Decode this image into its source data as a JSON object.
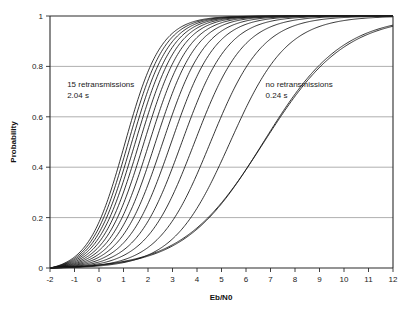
{
  "chart_data": {
    "type": "line",
    "title": "",
    "xlabel": "Eb/N0",
    "ylabel": "Probability",
    "xlim": [
      -2,
      12
    ],
    "ylim": [
      0,
      1
    ],
    "grid": true,
    "grid_axis": "y",
    "legend": "none",
    "xticks": [
      "-2",
      "-1",
      "0",
      "1",
      "2",
      "3",
      "4",
      "5",
      "6",
      "7",
      "8",
      "9",
      "10",
      "11",
      "12"
    ],
    "xtick_values": [
      -2,
      -1,
      0,
      1,
      2,
      3,
      4,
      5,
      6,
      7,
      8,
      9,
      10,
      11,
      12
    ],
    "yticks": [
      "0",
      "0.2",
      "0.4",
      "0.6",
      "0.8",
      "1"
    ],
    "ytick_values": [
      0,
      0.2,
      0.4,
      0.6,
      0.8,
      1
    ],
    "annotations": [
      {
        "name": "left-annotation",
        "line1": "15 retransmissions",
        "line2": "2.04 s",
        "x": -1.3,
        "y": 0.72
      },
      {
        "name": "right-annotation",
        "line1": "no retransmissions",
        "line2": "0.24 s",
        "x": 6.8,
        "y": 0.72
      }
    ],
    "series": [
      {
        "name": "15 retransmissions (2.04 s)",
        "midpoint": 1.05,
        "slope": 1.35,
        "values_x": [
          -2,
          -1,
          0,
          1,
          2,
          3,
          4,
          5,
          6,
          7,
          8,
          9,
          10,
          11,
          12
        ],
        "values": [
          0.017,
          0.057,
          0.196,
          0.5,
          0.804,
          0.943,
          0.983,
          0.995,
          0.999,
          1.0,
          1.0,
          1.0,
          1.0,
          1.0,
          1.0
        ]
      },
      {
        "name": "14 retransmissions",
        "midpoint": 1.18,
        "slope": 1.33,
        "values_x": [
          -2,
          -1,
          0,
          1,
          2,
          3,
          4,
          5,
          6,
          7,
          8,
          9,
          10,
          11,
          12
        ],
        "values": [
          0.015,
          0.05,
          0.173,
          0.44,
          0.76,
          0.925,
          0.979,
          0.994,
          0.998,
          1.0,
          1.0,
          1.0,
          1.0,
          1.0,
          1.0
        ]
      },
      {
        "name": "13 retransmissions",
        "midpoint": 1.32,
        "slope": 1.31,
        "values_x": [
          -2,
          -1,
          0,
          1,
          2,
          3,
          4,
          5,
          6,
          7,
          8,
          9,
          10,
          11,
          12
        ],
        "values": [
          0.013,
          0.045,
          0.153,
          0.4,
          0.72,
          0.91,
          0.974,
          0.992,
          0.998,
          0.999,
          1.0,
          1.0,
          1.0,
          1.0,
          1.0
        ]
      },
      {
        "name": "12 retransmissions",
        "midpoint": 1.47,
        "slope": 1.29,
        "values_x": [
          -2,
          -1,
          0,
          1,
          2,
          3,
          4,
          5,
          6,
          7,
          8,
          9,
          10,
          11,
          12
        ],
        "values": [
          0.012,
          0.04,
          0.136,
          0.36,
          0.675,
          0.89,
          0.968,
          0.99,
          0.997,
          0.999,
          1.0,
          1.0,
          1.0,
          1.0,
          1.0
        ]
      },
      {
        "name": "11 retransmissions",
        "midpoint": 1.64,
        "slope": 1.27,
        "values_x": [
          -2,
          -1,
          0,
          1,
          2,
          3,
          4,
          5,
          6,
          7,
          8,
          9,
          10,
          11,
          12
        ],
        "values": [
          0.011,
          0.036,
          0.12,
          0.32,
          0.625,
          0.865,
          0.959,
          0.987,
          0.996,
          0.999,
          1.0,
          1.0,
          1.0,
          1.0,
          1.0
        ]
      },
      {
        "name": "10 retransmissions",
        "midpoint": 1.83,
        "slope": 1.25,
        "values_x": [
          -2,
          -1,
          0,
          1,
          2,
          3,
          4,
          5,
          6,
          7,
          8,
          9,
          10,
          11,
          12
        ],
        "values": [
          0.01,
          0.032,
          0.105,
          0.282,
          0.57,
          0.833,
          0.948,
          0.984,
          0.995,
          0.998,
          0.999,
          1.0,
          1.0,
          1.0,
          1.0
        ]
      },
      {
        "name": "9 retransmissions",
        "midpoint": 2.05,
        "slope": 1.22,
        "values_x": [
          -2,
          -1,
          0,
          1,
          2,
          3,
          4,
          5,
          6,
          7,
          8,
          9,
          10,
          11,
          12
        ],
        "values": [
          0.009,
          0.029,
          0.091,
          0.244,
          0.513,
          0.795,
          0.932,
          0.979,
          0.994,
          0.998,
          0.999,
          1.0,
          1.0,
          1.0,
          1.0
        ]
      },
      {
        "name": "8 retransmissions",
        "midpoint": 2.3,
        "slope": 1.19,
        "values_x": [
          -2,
          -1,
          0,
          1,
          2,
          3,
          4,
          5,
          6,
          7,
          8,
          9,
          10,
          11,
          12
        ],
        "values": [
          0.008,
          0.026,
          0.079,
          0.208,
          0.45,
          0.748,
          0.911,
          0.972,
          0.992,
          0.997,
          0.999,
          1.0,
          1.0,
          1.0,
          1.0
        ]
      },
      {
        "name": "7 retransmissions",
        "midpoint": 2.6,
        "slope": 1.15,
        "values_x": [
          -2,
          -1,
          0,
          1,
          2,
          3,
          4,
          5,
          6,
          7,
          8,
          9,
          10,
          11,
          12
        ],
        "values": [
          0.007,
          0.023,
          0.068,
          0.173,
          0.382,
          0.69,
          0.882,
          0.962,
          0.989,
          0.996,
          0.999,
          1.0,
          1.0,
          1.0,
          1.0
        ]
      },
      {
        "name": "6 retransmissions",
        "midpoint": 2.95,
        "slope": 1.11,
        "values_x": [
          -2,
          -1,
          0,
          1,
          2,
          3,
          4,
          5,
          6,
          7,
          8,
          9,
          10,
          11,
          12
        ],
        "values": [
          0.006,
          0.02,
          0.058,
          0.142,
          0.315,
          0.614,
          0.843,
          0.947,
          0.984,
          0.995,
          0.998,
          0.999,
          1.0,
          1.0,
          1.0
        ]
      },
      {
        "name": "5 retransmissions",
        "midpoint": 3.38,
        "slope": 1.06,
        "values_x": [
          -2,
          -1,
          0,
          1,
          2,
          3,
          4,
          5,
          6,
          7,
          8,
          9,
          10,
          11,
          12
        ],
        "values": [
          0.005,
          0.017,
          0.048,
          0.114,
          0.251,
          0.512,
          0.786,
          0.923,
          0.975,
          0.992,
          0.997,
          0.999,
          1.0,
          1.0,
          1.0
        ]
      },
      {
        "name": "4 retransmissions",
        "midpoint": 3.9,
        "slope": 1.0,
        "values_x": [
          -2,
          -1,
          0,
          1,
          2,
          3,
          4,
          5,
          6,
          7,
          8,
          9,
          10,
          11,
          12
        ],
        "values": [
          0.003,
          0.013,
          0.038,
          0.09,
          0.194,
          0.389,
          0.711,
          0.888,
          0.961,
          0.987,
          0.995,
          0.998,
          0.999,
          1.0,
          1.0
        ]
      },
      {
        "name": "3 retransmissions",
        "midpoint": 4.55,
        "slope": 0.94,
        "values_x": [
          -2,
          -1,
          0,
          1,
          2,
          3,
          4,
          5,
          6,
          7,
          8,
          9,
          10,
          11,
          12
        ],
        "values": [
          0.002,
          0.01,
          0.029,
          0.069,
          0.148,
          0.292,
          0.557,
          0.826,
          0.935,
          0.977,
          0.991,
          0.997,
          0.999,
          1.0,
          1.0
        ]
      },
      {
        "name": "2 retransmissions",
        "midpoint": 5.35,
        "slope": 0.86,
        "values_x": [
          -2,
          -1,
          0,
          1,
          2,
          3,
          4,
          5,
          6,
          7,
          8,
          9,
          10,
          11,
          12
        ],
        "values": [
          0.001,
          0.006,
          0.02,
          0.049,
          0.108,
          0.213,
          0.391,
          0.639,
          0.846,
          0.944,
          0.98,
          0.993,
          0.997,
          0.999,
          1.0
        ]
      },
      {
        "name": "1 retransmission",
        "midpoint": 6.7,
        "slope": 0.62,
        "values_x": [
          -2,
          -1,
          0,
          1,
          2,
          3,
          4,
          5,
          6,
          7,
          8,
          9,
          10,
          11,
          12
        ],
        "values": [
          0.001,
          0.003,
          0.009,
          0.024,
          0.057,
          0.122,
          0.235,
          0.395,
          0.576,
          0.74,
          0.855,
          0.924,
          0.961,
          0.98,
          0.99
        ]
      },
      {
        "name": "no retransmissions (0.24 s)",
        "midpoint": 6.72,
        "slope": 0.6,
        "values_x": [
          -2,
          -1,
          0,
          1,
          2,
          3,
          4,
          5,
          6,
          7,
          8,
          9,
          10,
          11,
          12
        ],
        "values": [
          0.001,
          0.003,
          0.009,
          0.024,
          0.056,
          0.12,
          0.232,
          0.391,
          0.571,
          0.735,
          0.852,
          0.922,
          0.96,
          0.979,
          0.989
        ]
      }
    ]
  },
  "figure": {
    "background_color": "#ffffff",
    "curve_color": "#121212",
    "grid_color": "#9a9a9a",
    "axis_color": "#2b2b2b"
  }
}
